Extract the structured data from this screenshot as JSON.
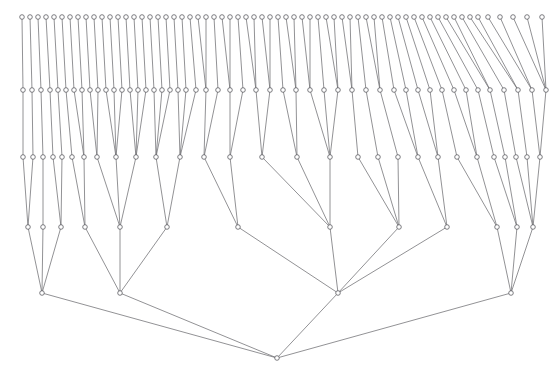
{
  "figure": {
    "title": "",
    "type": "hierarchical-tree-diagram",
    "width": 558,
    "height": 378,
    "background_color": "#ffffff",
    "edge_color": "#6e6e72",
    "node_stroke_color": "#5d5d62",
    "node_fill_color": "#ffffff",
    "node_radius": 2.3,
    "edge_width": 0.75,
    "orientation": "root-at-bottom",
    "level_count": 6
  },
  "chart_data": {
    "type": "tree",
    "title": "",
    "xlabel": "",
    "ylabel": "",
    "levels": [
      {
        "index": 0,
        "name": "leaves",
        "y": 17,
        "node_count": 63
      },
      {
        "index": 1,
        "name": "level-1",
        "y": 90,
        "node_count": 49
      },
      {
        "index": 2,
        "name": "level-2",
        "y": 157,
        "node_count": 29
      },
      {
        "index": 3,
        "name": "level-3",
        "y": 227,
        "node_count": 13
      },
      {
        "index": 4,
        "name": "level-4",
        "y": 293,
        "node_count": 4
      },
      {
        "index": 5,
        "name": "root",
        "y": 358,
        "node_count": 1
      }
    ],
    "nodes": {
      "level0": [
        {
          "id": "L0-0",
          "x": 22
        },
        {
          "id": "L0-1",
          "x": 30
        },
        {
          "id": "L0-2",
          "x": 38
        },
        {
          "id": "L0-3",
          "x": 46
        },
        {
          "id": "L0-4",
          "x": 54
        },
        {
          "id": "L0-5",
          "x": 62
        },
        {
          "id": "L0-6",
          "x": 70
        },
        {
          "id": "L0-7",
          "x": 78
        },
        {
          "id": "L0-8",
          "x": 86
        },
        {
          "id": "L0-9",
          "x": 94
        },
        {
          "id": "L0-10",
          "x": 102
        },
        {
          "id": "L0-11",
          "x": 110
        },
        {
          "id": "L0-12",
          "x": 118
        },
        {
          "id": "L0-13",
          "x": 126
        },
        {
          "id": "L0-14",
          "x": 134
        },
        {
          "id": "L0-15",
          "x": 142
        },
        {
          "id": "L0-16",
          "x": 150
        },
        {
          "id": "L0-17",
          "x": 158
        },
        {
          "id": "L0-18",
          "x": 166
        },
        {
          "id": "L0-19",
          "x": 174
        },
        {
          "id": "L0-20",
          "x": 182
        },
        {
          "id": "L0-21",
          "x": 190
        },
        {
          "id": "L0-22",
          "x": 198
        },
        {
          "id": "L0-23",
          "x": 206
        },
        {
          "id": "L0-24",
          "x": 214
        },
        {
          "id": "L0-25",
          "x": 222
        },
        {
          "id": "L0-26",
          "x": 230
        },
        {
          "id": "L0-27",
          "x": 238
        },
        {
          "id": "L0-28",
          "x": 246
        },
        {
          "id": "L0-29",
          "x": 254
        },
        {
          "id": "L0-30",
          "x": 262
        },
        {
          "id": "L0-31",
          "x": 270
        },
        {
          "id": "L0-32",
          "x": 278
        },
        {
          "id": "L0-33",
          "x": 286
        },
        {
          "id": "L0-34",
          "x": 294
        },
        {
          "id": "L0-35",
          "x": 302
        },
        {
          "id": "L0-36",
          "x": 310
        },
        {
          "id": "L0-37",
          "x": 318
        },
        {
          "id": "L0-38",
          "x": 326
        },
        {
          "id": "L0-39",
          "x": 334
        },
        {
          "id": "L0-40",
          "x": 342
        },
        {
          "id": "L0-41",
          "x": 350
        },
        {
          "id": "L0-42",
          "x": 358
        },
        {
          "id": "L0-43",
          "x": 366
        },
        {
          "id": "L0-44",
          "x": 374
        },
        {
          "id": "L0-45",
          "x": 382
        },
        {
          "id": "L0-46",
          "x": 390
        },
        {
          "id": "L0-47",
          "x": 398
        },
        {
          "id": "L0-48",
          "x": 406
        },
        {
          "id": "L0-49",
          "x": 414
        },
        {
          "id": "L0-50",
          "x": 422
        },
        {
          "id": "L0-51",
          "x": 430
        },
        {
          "id": "L0-52",
          "x": 438
        },
        {
          "id": "L0-53",
          "x": 446
        },
        {
          "id": "L0-54",
          "x": 454
        },
        {
          "id": "L0-55",
          "x": 462
        },
        {
          "id": "L0-56",
          "x": 470
        },
        {
          "id": "L0-57",
          "x": 478
        },
        {
          "id": "L0-58",
          "x": 488
        },
        {
          "id": "L0-59",
          "x": 500
        },
        {
          "id": "L0-60",
          "x": 513
        },
        {
          "id": "L0-61",
          "x": 527
        },
        {
          "id": "L0-62",
          "x": 542
        }
      ],
      "level1": [
        {
          "id": "L1-0",
          "x": 23,
          "children": [
            "L0-0"
          ]
        },
        {
          "id": "L1-1",
          "x": 32,
          "children": [
            "L0-1"
          ]
        },
        {
          "id": "L1-2",
          "x": 41,
          "children": [
            "L0-2"
          ]
        },
        {
          "id": "L1-3",
          "x": 50,
          "children": [
            "L0-3"
          ]
        },
        {
          "id": "L1-4",
          "x": 58,
          "children": [
            "L0-4"
          ]
        },
        {
          "id": "L1-5",
          "x": 66,
          "children": [
            "L0-5"
          ]
        },
        {
          "id": "L1-6",
          "x": 74,
          "children": [
            "L0-6"
          ]
        },
        {
          "id": "L1-7",
          "x": 82,
          "children": [
            "L0-7"
          ]
        },
        {
          "id": "L1-8",
          "x": 90,
          "children": [
            "L0-8"
          ]
        },
        {
          "id": "L1-9",
          "x": 98,
          "children": [
            "L0-9"
          ]
        },
        {
          "id": "L1-10",
          "x": 106,
          "children": [
            "L0-10"
          ]
        },
        {
          "id": "L1-11",
          "x": 114,
          "children": [
            "L0-11"
          ]
        },
        {
          "id": "L1-12",
          "x": 122,
          "children": [
            "L0-12"
          ]
        },
        {
          "id": "L1-13",
          "x": 130,
          "children": [
            "L0-13"
          ]
        },
        {
          "id": "L1-14",
          "x": 138,
          "children": [
            "L0-14"
          ]
        },
        {
          "id": "L1-15",
          "x": 146,
          "children": [
            "L0-15"
          ]
        },
        {
          "id": "L1-16",
          "x": 154,
          "children": [
            "L0-16"
          ]
        },
        {
          "id": "L1-17",
          "x": 162,
          "children": [
            "L0-17"
          ]
        },
        {
          "id": "L1-18",
          "x": 170,
          "children": [
            "L0-18"
          ]
        },
        {
          "id": "L1-19",
          "x": 178,
          "children": [
            "L0-19"
          ]
        },
        {
          "id": "L1-20",
          "x": 186,
          "children": [
            "L0-20"
          ]
        },
        {
          "id": "L1-21",
          "x": 196,
          "children": [
            "L0-21"
          ]
        },
        {
          "id": "L1-22",
          "x": 206,
          "children": [
            "L0-22",
            "L0-23"
          ]
        },
        {
          "id": "L1-23",
          "x": 218,
          "children": [
            "L0-24"
          ]
        },
        {
          "id": "L1-24",
          "x": 230,
          "children": [
            "L0-25",
            "L0-26"
          ]
        },
        {
          "id": "L1-25",
          "x": 243,
          "children": [
            "L0-27"
          ]
        },
        {
          "id": "L1-26",
          "x": 256,
          "children": [
            "L0-28",
            "L0-29"
          ]
        },
        {
          "id": "L1-27",
          "x": 270,
          "children": [
            "L0-30",
            "L0-31"
          ]
        },
        {
          "id": "L1-28",
          "x": 283,
          "children": [
            "L0-32"
          ]
        },
        {
          "id": "L1-29",
          "x": 296,
          "children": [
            "L0-33",
            "L0-34"
          ]
        },
        {
          "id": "L1-30",
          "x": 310,
          "children": [
            "L0-35",
            "L0-36"
          ]
        },
        {
          "id": "L1-31",
          "x": 324,
          "children": [
            "L0-37"
          ]
        },
        {
          "id": "L1-32",
          "x": 338,
          "children": [
            "L0-38",
            "L0-39"
          ]
        },
        {
          "id": "L1-33",
          "x": 352,
          "children": [
            "L0-40",
            "L0-41"
          ]
        },
        {
          "id": "L1-34",
          "x": 366,
          "children": [
            "L0-42"
          ]
        },
        {
          "id": "L1-35",
          "x": 380,
          "children": [
            "L0-43",
            "L0-44"
          ]
        },
        {
          "id": "L1-36",
          "x": 394,
          "children": [
            "L0-45"
          ]
        },
        {
          "id": "L1-37",
          "x": 406,
          "children": [
            "L0-46"
          ]
        },
        {
          "id": "L1-38",
          "x": 418,
          "children": [
            "L0-47"
          ]
        },
        {
          "id": "L1-39",
          "x": 430,
          "children": [
            "L0-48"
          ]
        },
        {
          "id": "L1-40",
          "x": 442,
          "children": [
            "L0-49"
          ]
        },
        {
          "id": "L1-41",
          "x": 454,
          "children": [
            "L0-50"
          ]
        },
        {
          "id": "L1-42",
          "x": 466,
          "children": [
            "L0-51"
          ]
        },
        {
          "id": "L1-43",
          "x": 478,
          "children": [
            "L0-52"
          ]
        },
        {
          "id": "L1-44",
          "x": 490,
          "children": [
            "L0-53",
            "L0-54"
          ]
        },
        {
          "id": "L1-45",
          "x": 504,
          "children": [
            "L0-55"
          ]
        },
        {
          "id": "L1-46",
          "x": 518,
          "children": [
            "L0-56",
            "L0-57"
          ]
        },
        {
          "id": "L1-47",
          "x": 532,
          "children": [
            "L0-58",
            "L0-59"
          ]
        },
        {
          "id": "L1-48",
          "x": 546,
          "children": [
            "L0-60",
            "L0-61",
            "L0-62"
          ]
        }
      ],
      "level2": [
        {
          "id": "L2-0",
          "x": 23,
          "children": [
            "L1-0"
          ]
        },
        {
          "id": "L2-1",
          "x": 33,
          "children": [
            "L1-1"
          ]
        },
        {
          "id": "L2-2",
          "x": 43,
          "children": [
            "L1-2"
          ]
        },
        {
          "id": "L2-3",
          "x": 53,
          "children": [
            "L1-3"
          ]
        },
        {
          "id": "L2-4",
          "x": 62,
          "children": [
            "L1-4"
          ]
        },
        {
          "id": "L2-5",
          "x": 72,
          "children": [
            "L1-5"
          ]
        },
        {
          "id": "L2-6",
          "x": 84,
          "children": [
            "L1-6",
            "L1-7"
          ]
        },
        {
          "id": "L2-7",
          "x": 97,
          "children": [
            "L1-8",
            "L1-9"
          ]
        },
        {
          "id": "L2-8",
          "x": 116,
          "children": [
            "L1-10",
            "L1-11",
            "L1-12"
          ]
        },
        {
          "id": "L2-9",
          "x": 136,
          "children": [
            "L1-13",
            "L1-14",
            "L1-15"
          ]
        },
        {
          "id": "L2-10",
          "x": 156,
          "children": [
            "L1-16",
            "L1-17",
            "L1-18"
          ]
        },
        {
          "id": "L2-11",
          "x": 180,
          "children": [
            "L1-19",
            "L1-20",
            "L1-21"
          ]
        },
        {
          "id": "L2-12",
          "x": 204,
          "children": [
            "L1-22",
            "L1-23"
          ]
        },
        {
          "id": "L2-13",
          "x": 230,
          "children": [
            "L1-24",
            "L1-25"
          ]
        },
        {
          "id": "L2-14",
          "x": 262,
          "children": [
            "L1-26",
            "L1-27"
          ]
        },
        {
          "id": "L2-15",
          "x": 297,
          "children": [
            "L1-28",
            "L1-29"
          ]
        },
        {
          "id": "L2-16",
          "x": 330,
          "children": [
            "L1-30",
            "L1-31",
            "L1-32"
          ]
        },
        {
          "id": "L2-17",
          "x": 358,
          "children": [
            "L1-33"
          ]
        },
        {
          "id": "L2-18",
          "x": 378,
          "children": [
            "L1-34"
          ]
        },
        {
          "id": "L2-19",
          "x": 398,
          "children": [
            "L1-35"
          ]
        },
        {
          "id": "L2-20",
          "x": 418,
          "children": [
            "L1-36",
            "L1-37"
          ]
        },
        {
          "id": "L2-21",
          "x": 438,
          "children": [
            "L1-38",
            "L1-39"
          ]
        },
        {
          "id": "L2-22",
          "x": 457,
          "children": [
            "L1-40"
          ]
        },
        {
          "id": "L2-23",
          "x": 477,
          "children": [
            "L1-41",
            "L1-42"
          ]
        },
        {
          "id": "L2-24",
          "x": 494,
          "children": [
            "L1-43"
          ]
        },
        {
          "id": "L2-25",
          "x": 505,
          "children": [
            "L1-44"
          ]
        },
        {
          "id": "L2-26",
          "x": 516,
          "children": [
            "L1-45"
          ]
        },
        {
          "id": "L2-27",
          "x": 527,
          "children": [
            "L1-46"
          ]
        },
        {
          "id": "L2-28",
          "x": 540,
          "children": [
            "L1-47",
            "L1-48"
          ]
        }
      ],
      "level3": [
        {
          "id": "L3-0",
          "x": 28,
          "children": [
            "L2-0",
            "L2-1"
          ]
        },
        {
          "id": "L3-1",
          "x": 43,
          "children": [
            "L2-2"
          ]
        },
        {
          "id": "L3-2",
          "x": 61,
          "children": [
            "L2-3",
            "L2-4"
          ]
        },
        {
          "id": "L3-3",
          "x": 85,
          "children": [
            "L2-5",
            "L2-6"
          ]
        },
        {
          "id": "L3-4",
          "x": 120,
          "children": [
            "L2-7",
            "L2-8",
            "L2-9"
          ]
        },
        {
          "id": "L3-5",
          "x": 167,
          "children": [
            "L2-10",
            "L2-11"
          ]
        },
        {
          "id": "L3-6",
          "x": 238,
          "children": [
            "L2-12",
            "L2-13"
          ]
        },
        {
          "id": "L3-7",
          "x": 330,
          "children": [
            "L2-14",
            "L2-15",
            "L2-16"
          ]
        },
        {
          "id": "L3-8",
          "x": 399,
          "children": [
            "L2-17",
            "L2-18",
            "L2-19"
          ]
        },
        {
          "id": "L3-9",
          "x": 447,
          "children": [
            "L2-20",
            "L2-21"
          ]
        },
        {
          "id": "L3-10",
          "x": 497,
          "children": [
            "L2-22",
            "L2-23"
          ]
        },
        {
          "id": "L3-11",
          "x": 517,
          "children": [
            "L2-24",
            "L2-25"
          ]
        },
        {
          "id": "L3-12",
          "x": 533,
          "children": [
            "L2-26",
            "L2-27",
            "L2-28"
          ]
        }
      ],
      "level4": [
        {
          "id": "L4-0",
          "x": 42,
          "children": [
            "L3-0",
            "L3-1",
            "L3-2"
          ]
        },
        {
          "id": "L4-1",
          "x": 120,
          "children": [
            "L3-3",
            "L3-4",
            "L3-5"
          ]
        },
        {
          "id": "L4-2",
          "x": 338,
          "children": [
            "L3-6",
            "L3-7",
            "L3-8",
            "L3-9"
          ]
        },
        {
          "id": "L4-3",
          "x": 511,
          "children": [
            "L3-10",
            "L3-11",
            "L3-12"
          ]
        }
      ],
      "level5": [
        {
          "id": "ROOT",
          "x": 277,
          "children": [
            "L4-0",
            "L4-1",
            "L4-2",
            "L4-3"
          ]
        }
      ]
    }
  }
}
